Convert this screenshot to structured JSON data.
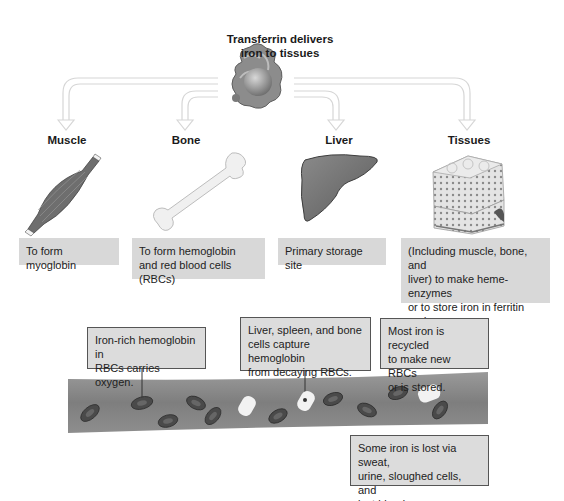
{
  "title": "Transferrin delivers iron to tissues",
  "title_lines": [
    "Transferrin delivers",
    "iron to tissues"
  ],
  "destinations": [
    {
      "label": "Muscle",
      "icon": "muscle-icon",
      "description": "To form myoglobin"
    },
    {
      "label": "Bone",
      "icon": "bone-icon",
      "description_lines": [
        "To form hemoglobin",
        "and red blood cells (RBCs)"
      ]
    },
    {
      "label": "Liver",
      "icon": "liver-icon",
      "description": "Primary storage site"
    },
    {
      "label": "Tissues",
      "icon": "tissue-icon",
      "description_lines": [
        "(Including muscle, bone, and",
        "liver) to make heme-enzymes",
        "or to store iron in ferritin and",
        "hemosiderin"
      ]
    }
  ],
  "callouts": {
    "rbc_oxygen": [
      "Iron-rich hemoglobin in",
      "RBCs carries oxygen."
    ],
    "capture": [
      "Liver, spleen, and bone",
      "cells capture hemoglobin",
      "from decaying RBCs."
    ],
    "recycled": [
      "Most iron is recycled",
      "to make new RBCs",
      "or is stored."
    ],
    "lost": [
      "Some iron is lost via sweat,",
      "urine, sloughed cells, and",
      "lost blood."
    ]
  },
  "colors": {
    "box_fill": "#d8d8d8",
    "callout_border": "#555555",
    "vessel": "#8a8a8a",
    "rbc": "#444444",
    "arrow": "#dddddd"
  }
}
